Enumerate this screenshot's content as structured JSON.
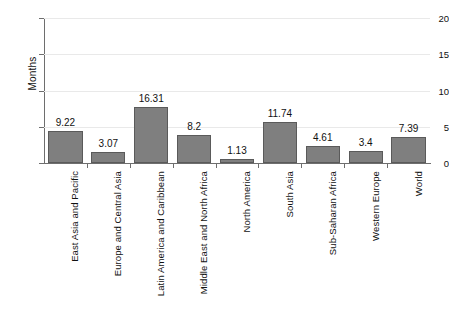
{
  "chart_data": {
    "type": "bar",
    "title": "",
    "subtitle": "",
    "xlabel": "",
    "ylabel": "Months",
    "ylim": [
      0,
      20
    ],
    "yticks": [
      0,
      5,
      10,
      15,
      20
    ],
    "grid": true,
    "legend": false,
    "legend_position": "none",
    "bar_color": "#7f7f7f",
    "bar_edge_color": "#5a5a5a",
    "gridline_color": "#e9e9e9",
    "axis_color": "#6e6e6e",
    "categories": [
      "East Asia and Pacific",
      "Europe and Central Asia",
      "Latin America and Caribbean",
      "Middle East and North Africa",
      "North America",
      "South Asia",
      "Sub-Saharan Africa",
      "Western Europe",
      "World"
    ],
    "values": [
      9.22,
      3.07,
      16.31,
      8.2,
      1.13,
      11.74,
      4.61,
      3.4,
      7.39
    ],
    "value_labels": [
      "9.22",
      "3.07",
      "16.31",
      "8.2",
      "1.13",
      "11.74",
      "4.61",
      "3.4",
      "7.39"
    ],
    "plotted_bar_heights": [
      4.42,
      1.47,
      7.72,
      3.93,
      0.55,
      5.65,
      2.3,
      1.72,
      3.62
    ]
  },
  "axis": {
    "y_tick_labels": [
      "0",
      "5",
      "10",
      "15",
      "20"
    ],
    "y_title": "Months"
  }
}
